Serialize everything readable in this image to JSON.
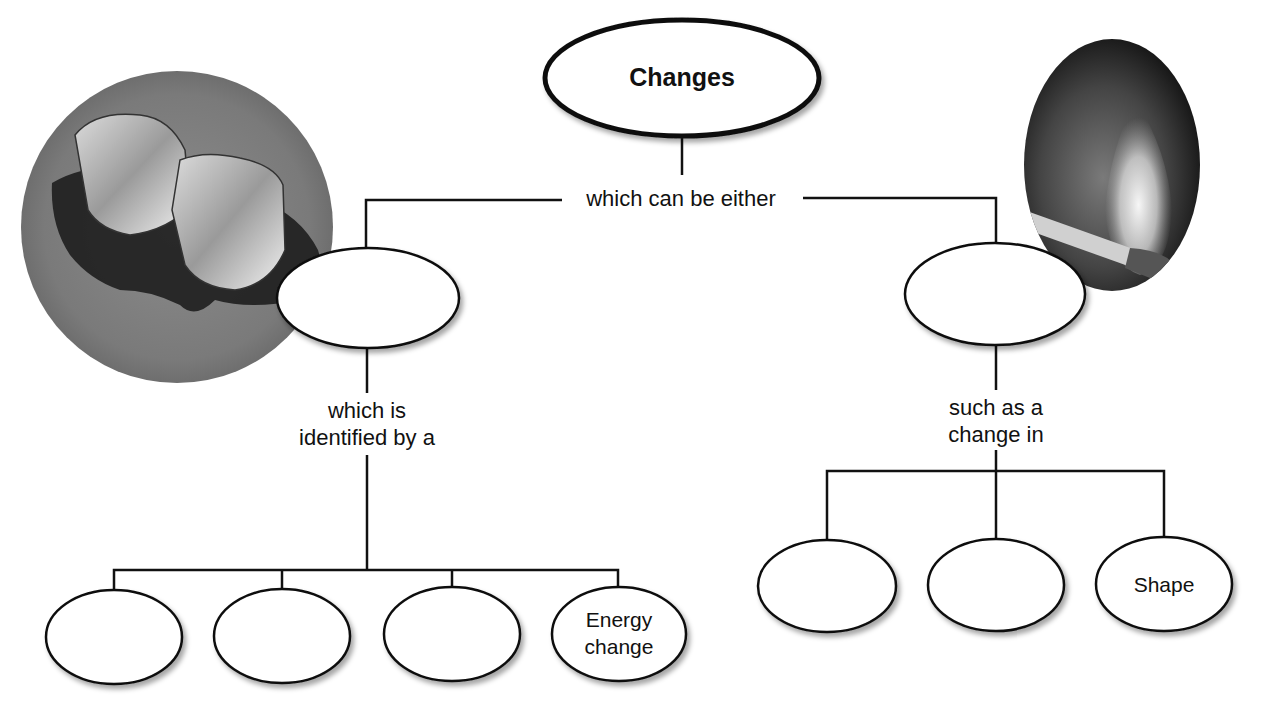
{
  "diagram": {
    "title": "Changes",
    "connector_top": "which can be either",
    "left_branch": {
      "node_label": "",
      "connector": [
        "which is",
        "identified by a"
      ],
      "children": [
        "",
        "",
        "",
        "Energy change"
      ],
      "children_lines": [
        [
          "",
          ""
        ],
        [
          "",
          ""
        ],
        [
          "",
          ""
        ],
        [
          "Energy",
          "change"
        ]
      ],
      "photo": "ice-cubes-melting"
    },
    "right_branch": {
      "node_label": "",
      "connector": [
        "such as a",
        "change in"
      ],
      "children": [
        "",
        "",
        "Shape"
      ],
      "photo": "burning-match"
    }
  },
  "colors": {
    "line": "#111111",
    "node_fill": "#ffffff",
    "background": "#ffffff"
  }
}
